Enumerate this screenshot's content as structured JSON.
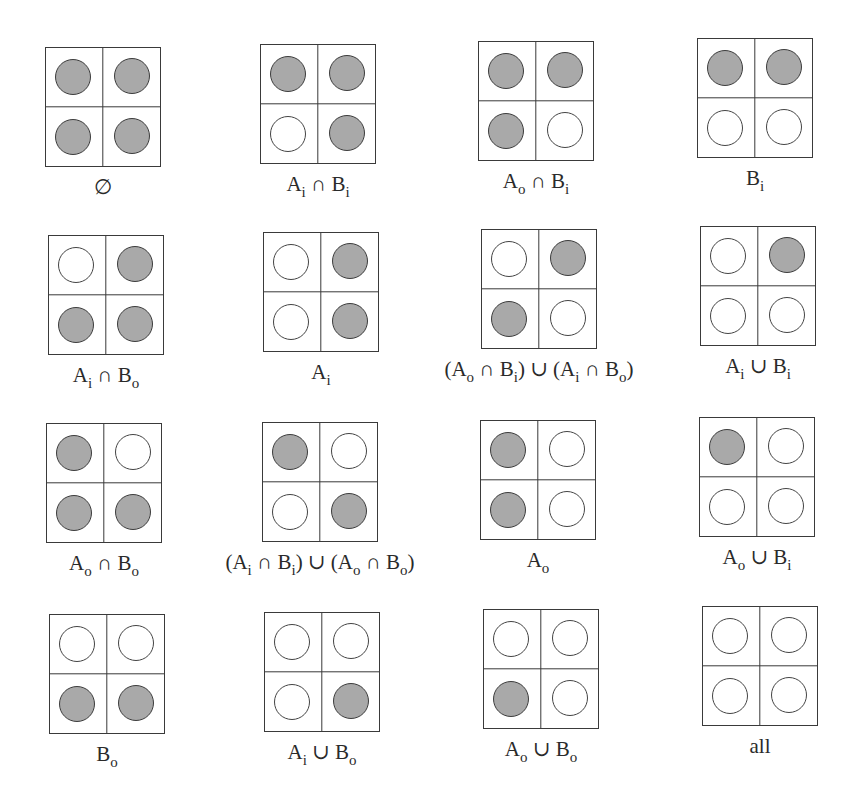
{
  "title": "",
  "legend": {
    "filled_meaning": "shaded",
    "empty_meaning": "unshaded",
    "fill_color": "#a9a9a9",
    "stroke_color": "#3a3a3a"
  },
  "quadrant_order": [
    "top-left",
    "top-right",
    "bottom-left",
    "bottom-right"
  ],
  "panels": [
    {
      "label": [
        {
          "t": "∅"
        }
      ],
      "filled": [
        true,
        true,
        true,
        true
      ]
    },
    {
      "label": [
        {
          "t": "A"
        },
        {
          "s": "i"
        },
        {
          "t": " ∩ B"
        },
        {
          "s": "i"
        }
      ],
      "filled": [
        true,
        true,
        false,
        true
      ]
    },
    {
      "label": [
        {
          "t": "A"
        },
        {
          "s": "o"
        },
        {
          "t": " ∩ B"
        },
        {
          "s": "i"
        }
      ],
      "filled": [
        true,
        true,
        true,
        false
      ]
    },
    {
      "label": [
        {
          "t": "B"
        },
        {
          "s": "i"
        }
      ],
      "filled": [
        true,
        true,
        false,
        false
      ]
    },
    {
      "label": [
        {
          "t": "A"
        },
        {
          "s": "i"
        },
        {
          "t": " ∩ B"
        },
        {
          "s": "o"
        }
      ],
      "filled": [
        false,
        true,
        true,
        true
      ]
    },
    {
      "label": [
        {
          "t": "A"
        },
        {
          "s": "i"
        }
      ],
      "filled": [
        false,
        true,
        false,
        true
      ]
    },
    {
      "label": [
        {
          "t": "(A"
        },
        {
          "s": "o"
        },
        {
          "t": " ∩ B"
        },
        {
          "s": "i"
        },
        {
          "t": ") ∪ (A"
        },
        {
          "s": "i"
        },
        {
          "t": " ∩ B"
        },
        {
          "s": "o"
        },
        {
          "t": ")"
        }
      ],
      "filled": [
        false,
        true,
        true,
        false
      ]
    },
    {
      "label": [
        {
          "t": "A"
        },
        {
          "s": "i"
        },
        {
          "t": " ∪ B"
        },
        {
          "s": "i"
        }
      ],
      "filled": [
        false,
        true,
        false,
        false
      ]
    },
    {
      "label": [
        {
          "t": "A"
        },
        {
          "s": "o"
        },
        {
          "t": " ∩ B"
        },
        {
          "s": "o"
        }
      ],
      "filled": [
        true,
        false,
        true,
        true
      ]
    },
    {
      "label": [
        {
          "t": "(A"
        },
        {
          "s": "i"
        },
        {
          "t": " ∩ B"
        },
        {
          "s": "i"
        },
        {
          "t": ") ∪ (A"
        },
        {
          "s": "o"
        },
        {
          "t": " ∩ B"
        },
        {
          "s": "o"
        },
        {
          "t": ")"
        }
      ],
      "filled": [
        true,
        false,
        false,
        true
      ]
    },
    {
      "label": [
        {
          "t": "A"
        },
        {
          "s": "o"
        }
      ],
      "filled": [
        true,
        false,
        true,
        false
      ]
    },
    {
      "label": [
        {
          "t": "A"
        },
        {
          "s": "o"
        },
        {
          "t": " ∪ B"
        },
        {
          "s": "i"
        }
      ],
      "filled": [
        true,
        false,
        false,
        false
      ]
    },
    {
      "label": [
        {
          "t": "B"
        },
        {
          "s": "o"
        }
      ],
      "filled": [
        false,
        false,
        true,
        true
      ]
    },
    {
      "label": [
        {
          "t": "A"
        },
        {
          "s": "i"
        },
        {
          "t": " ∪ B"
        },
        {
          "s": "o"
        }
      ],
      "filled": [
        false,
        false,
        false,
        true
      ]
    },
    {
      "label": [
        {
          "t": "A"
        },
        {
          "s": "o"
        },
        {
          "t": " ∪ B"
        },
        {
          "s": "o"
        }
      ],
      "filled": [
        false,
        false,
        true,
        false
      ]
    },
    {
      "label": [
        {
          "t": "all"
        }
      ],
      "filled": [
        false,
        false,
        false,
        false
      ]
    }
  ]
}
